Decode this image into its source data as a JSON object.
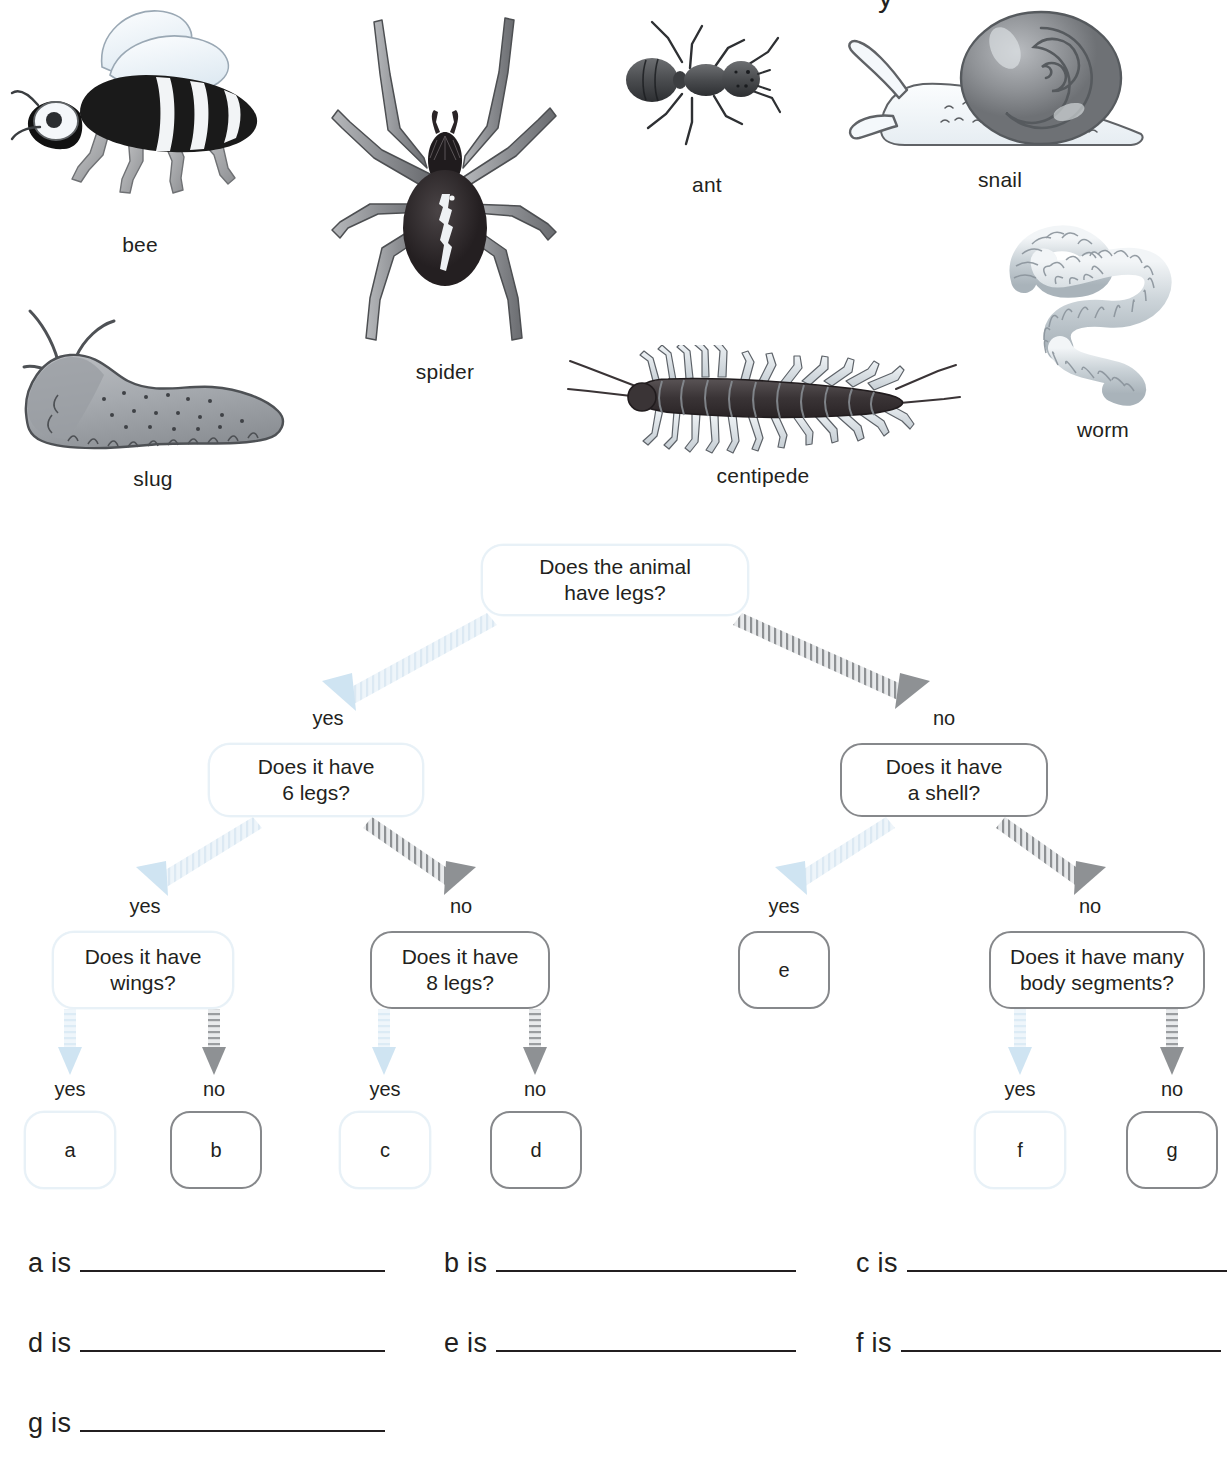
{
  "gallery": {
    "specimens": [
      {
        "id": "bee",
        "label": "bee"
      },
      {
        "id": "spider",
        "label": "spider"
      },
      {
        "id": "ant",
        "label": "ant"
      },
      {
        "id": "snail",
        "label": "snail"
      },
      {
        "id": "slug",
        "label": "slug"
      },
      {
        "id": "centipede",
        "label": "centipede"
      },
      {
        "id": "worm",
        "label": "worm"
      }
    ],
    "cut_glyph": "y"
  },
  "tree": {
    "nodes": {
      "root": "Does the animal\nhave legs?",
      "six_legs": "Does it have\n6 legs?",
      "shell": "Does it have\na shell?",
      "wings": "Does it have\nwings?",
      "eight_legs": "Does it have\n8 legs?",
      "leaf_e": "e",
      "body_segments": "Does it have many\nbody segments?",
      "leaf_a": "a",
      "leaf_b": "b",
      "leaf_c": "c",
      "leaf_d": "d",
      "leaf_f": "f",
      "leaf_g": "g"
    },
    "edge_labels": {
      "root_yes": "yes",
      "root_no": "no",
      "six_yes": "yes",
      "six_no": "no",
      "shell_yes": "yes",
      "shell_no": "no",
      "wings_yes": "yes",
      "wings_no": "no",
      "eight_yes": "yes",
      "eight_no": "no",
      "seg_yes": "yes",
      "seg_no": "no"
    },
    "colors": {
      "light_branch": "#e3eef6",
      "dark_branch": "#8a8c8f",
      "node_light_border": "#e8f1f7",
      "node_dark_border": "#86888b",
      "text": "#231f20"
    }
  },
  "answers": {
    "rows": [
      {
        "key": "a is",
        "left": 28,
        "top": 16,
        "width": 305
      },
      {
        "key": "b is",
        "left": 444,
        "top": 16,
        "width": 300
      },
      {
        "key": "c is",
        "left": 856,
        "top": 16,
        "width": 320
      },
      {
        "key": "d is",
        "left": 28,
        "top": 96,
        "width": 305
      },
      {
        "key": "e is",
        "left": 444,
        "top": 96,
        "width": 300
      },
      {
        "key": "f is",
        "left": 856,
        "top": 96,
        "width": 320
      },
      {
        "key": "g is",
        "left": 28,
        "top": 176,
        "width": 305
      }
    ]
  }
}
